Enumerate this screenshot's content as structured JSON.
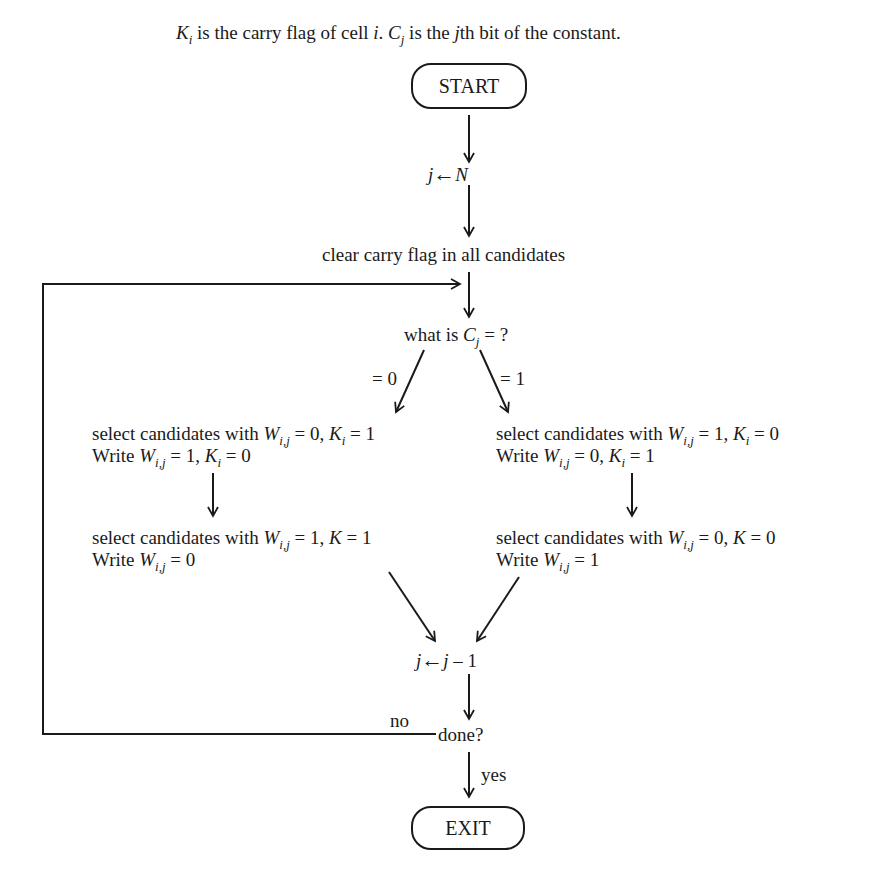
{
  "header": {
    "K_sym": "K",
    "K_sub": "i",
    "part1": " is the carry flag of cell ",
    "i_sym": "i",
    "part2": ".  ",
    "C_sym": "C",
    "C_sub": "j",
    "part3": " is the ",
    "j_sym": "j",
    "part4": "th bit of the constant."
  },
  "nodes": {
    "start": "START",
    "init": {
      "lhs": "j",
      "arrow": "←",
      "rhs": "N"
    },
    "clear": "clear carry flag in all candidates",
    "decision": {
      "prefix": "what is ",
      "C": "C",
      "sub": "j",
      "suffix": " = ?"
    },
    "branch_zero_label": "= 0",
    "branch_one_label": "= 1",
    "left_step1": {
      "line1": {
        "pre": "select candidates with ",
        "W": "W",
        "Wsub": "i,j",
        "mid": " = 0, ",
        "K": "K",
        "Ksub": "i",
        "post": " = 1"
      },
      "line2": {
        "pre": "Write ",
        "W": "W",
        "Wsub": "i,j",
        "mid": " = 1, ",
        "K": "K",
        "Ksub": "i",
        "post": " = 0"
      }
    },
    "left_step2": {
      "line1": {
        "pre": "select candidates with ",
        "W": "W",
        "Wsub": "i,j",
        "mid": " = 1, ",
        "K": "K",
        "post": " = 1"
      },
      "line2": {
        "pre": "Write ",
        "W": "W",
        "Wsub": "i,j",
        "post": " = 0"
      }
    },
    "right_step1": {
      "line1": {
        "pre": "select candidates with ",
        "W": "W",
        "Wsub": "i,j",
        "mid": " = 1, ",
        "K": "K",
        "Ksub": "i",
        "post": " = 0"
      },
      "line2": {
        "pre": "Write ",
        "W": "W",
        "Wsub": "i,j",
        "mid": " = 0, ",
        "K": "K",
        "Ksub": "i",
        "post": " = 1"
      }
    },
    "right_step2": {
      "line1": {
        "pre": "select candidates with ",
        "W": "W",
        "Wsub": "i,j",
        "mid": " = 0, ",
        "K": "K",
        "post": " = 0"
      },
      "line2": {
        "pre": "Write ",
        "W": "W",
        "Wsub": "i,j",
        "post": " = 1"
      }
    },
    "decrement": {
      "lhs": "j",
      "arrow": "←",
      "rhs_var": "j",
      "rhs_op": " – 1"
    },
    "done": "done?",
    "no_label": "no",
    "yes_label": "yes",
    "exit": "EXIT"
  },
  "colors": {
    "ink": "#1a1a1a",
    "background": "#ffffff"
  }
}
